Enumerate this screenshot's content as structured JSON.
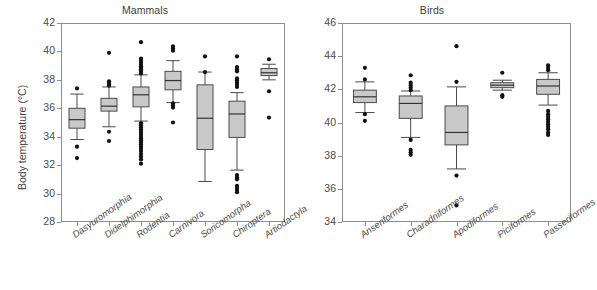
{
  "figure": {
    "width": 574,
    "height": 290,
    "background": "#ffffff",
    "axis_color": "#8d8d8d",
    "box_fill": "#c9c9c9",
    "box_edge": "#4a4a4a",
    "outlier_color": "#111111",
    "ylabel": "Body temperature (°C)"
  },
  "chart_data": [
    {
      "type": "box",
      "title": "Mammals",
      "xlabel": "",
      "ylabel": "Body temperature (°C)",
      "ylim": [
        28,
        42
      ],
      "yticks": [
        28,
        30,
        32,
        34,
        36,
        38,
        40,
        42
      ],
      "grid": false,
      "legend": "none",
      "categories": [
        "Dasyuromorphia",
        "Didelphimorphia",
        "Rodentia",
        "Carnivora",
        "Soricomorpha",
        "Chiroptera",
        "Artiodactyla"
      ],
      "boxes": [
        {
          "name": "Dasyuromorphia",
          "whisker_low": 33.8,
          "q1": 34.6,
          "median": 35.2,
          "q3": 36.0,
          "whisker_high": 37.0,
          "outliers": [
            37.4,
            33.3,
            32.5
          ]
        },
        {
          "name": "Didelphimorphia",
          "whisker_low": 34.7,
          "q1": 35.8,
          "median": 36.15,
          "q3": 36.7,
          "whisker_high": 37.5,
          "outliers": [
            39.9,
            37.9,
            37.75,
            37.6,
            34.35,
            33.7
          ]
        },
        {
          "name": "Rodentia",
          "whisker_low": 35.1,
          "q1": 36.1,
          "median": 36.95,
          "q3": 37.5,
          "whisker_high": 38.35,
          "outliers": [
            40.65,
            39.5,
            39.35,
            39.2,
            39.05,
            38.95,
            38.85,
            38.75,
            38.65,
            38.55,
            38.45,
            34.95,
            34.8,
            34.65,
            34.5,
            34.35,
            34.2,
            34.05,
            33.9,
            33.75,
            33.6,
            33.45,
            33.3,
            33.15,
            33.0,
            32.8,
            32.6,
            32.4,
            32.1
          ]
        },
        {
          "name": "Carnivora",
          "whisker_low": 36.4,
          "q1": 37.3,
          "median": 37.95,
          "q3": 38.6,
          "whisker_high": 39.35,
          "outliers": [
            40.35,
            40.2,
            40.05,
            36.35,
            36.2,
            36.05,
            35.0
          ]
        },
        {
          "name": "Soricomorpha",
          "whisker_low": 30.85,
          "q1": 33.1,
          "median": 35.3,
          "q3": 37.65,
          "whisker_high": 38.55,
          "outliers": [
            39.65,
            38.55
          ]
        },
        {
          "name": "Chiroptera",
          "whisker_low": 31.65,
          "q1": 33.95,
          "median": 35.6,
          "q3": 36.5,
          "whisker_high": 37.1,
          "outliers": [
            39.65,
            38.9,
            38.75,
            38.6,
            38.1,
            37.95,
            37.8,
            37.65,
            37.5,
            31.3,
            31.15,
            31.0,
            30.55,
            30.4,
            30.25,
            30.1
          ]
        },
        {
          "name": "Artiodactyla",
          "whisker_low": 38.0,
          "q1": 38.3,
          "median": 38.5,
          "q3": 38.8,
          "whisker_high": 39.1,
          "outliers": [
            39.45,
            37.2,
            35.35
          ]
        }
      ]
    },
    {
      "type": "box",
      "title": "Birds",
      "xlabel": "",
      "ylabel": "",
      "ylim": [
        34,
        46
      ],
      "yticks": [
        34,
        36,
        38,
        40,
        42,
        44,
        46
      ],
      "grid": false,
      "legend": "none",
      "categories": [
        "Anseriformes",
        "Charadriiformes",
        "Apodiformes",
        "Piciformes",
        "Passeriformes"
      ],
      "boxes": [
        {
          "name": "Anseriformes",
          "whisker_low": 40.6,
          "q1": 41.2,
          "median": 41.55,
          "q3": 41.95,
          "whisker_high": 42.45,
          "outliers": [
            43.3,
            42.6,
            40.5,
            40.1
          ]
        },
        {
          "name": "Charadriiformes",
          "whisker_low": 39.1,
          "q1": 40.25,
          "median": 41.15,
          "q3": 41.6,
          "whisker_high": 41.9,
          "outliers": [
            42.85,
            42.4,
            42.25,
            42.1,
            41.95,
            38.95,
            38.35,
            38.2,
            38.05
          ]
        },
        {
          "name": "Apodiformes",
          "whisker_low": 37.2,
          "q1": 38.65,
          "median": 39.4,
          "q3": 41.0,
          "whisker_high": 42.15,
          "outliers": [
            44.6,
            42.45,
            36.8,
            35.0
          ]
        },
        {
          "name": "Piciformes",
          "whisker_low": 41.95,
          "q1": 42.1,
          "median": 42.25,
          "q3": 42.4,
          "whisker_high": 42.55,
          "outliers": [
            43.0,
            41.65,
            41.55
          ]
        },
        {
          "name": "Passeriformes",
          "whisker_low": 41.05,
          "q1": 41.7,
          "median": 42.2,
          "q3": 42.6,
          "whisker_high": 43.0,
          "outliers": [
            43.45,
            43.3,
            43.15,
            40.7,
            40.5,
            40.35,
            40.2,
            40.05,
            39.9,
            39.75,
            39.6,
            39.4,
            39.25
          ]
        }
      ]
    }
  ]
}
